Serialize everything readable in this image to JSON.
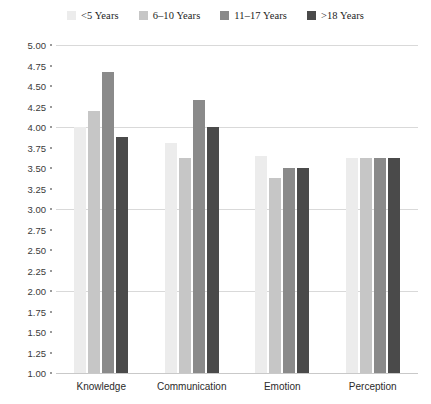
{
  "chart_data": {
    "type": "bar",
    "title": "",
    "xlabel": "",
    "ylabel": "",
    "ylim": [
      1.0,
      5.0
    ],
    "ytick_step": 0.25,
    "grid": true,
    "grid_major_values": [
      5.0,
      4.0,
      3.0,
      2.0,
      1.0
    ],
    "legend_position": "top-center",
    "categories": [
      "Knowledge",
      "Communication",
      "Emotion",
      "Perception"
    ],
    "ytick_labels": [
      "5.00",
      "4.75",
      "4.50",
      "4.25",
      "4.00",
      "3.75",
      "3.50",
      "3.25",
      "3.00",
      "2.75",
      "2.50",
      "2.25",
      "2.00",
      "1.75",
      "1.50",
      "1.25",
      "1.00"
    ],
    "ytick_values": [
      5.0,
      4.75,
      4.5,
      4.25,
      4.0,
      3.75,
      3.5,
      3.25,
      3.0,
      2.75,
      2.5,
      2.25,
      2.0,
      1.75,
      1.5,
      1.25,
      1.0
    ],
    "series": [
      {
        "name": "<5 Years",
        "color": "#ececec",
        "values": [
          4.0,
          3.8,
          3.65,
          3.62
        ]
      },
      {
        "name": "6–10 Years",
        "color": "#c6c6c6",
        "values": [
          4.2,
          3.62,
          3.38,
          3.62
        ]
      },
      {
        "name": "11–17 Years",
        "color": "#8a8a8a",
        "values": [
          4.67,
          4.33,
          3.5,
          3.62
        ]
      },
      {
        "name": ">18 Years",
        "color": "#4a4a4a",
        "values": [
          3.88,
          4.0,
          3.5,
          3.62
        ]
      }
    ]
  },
  "colors": {
    "gridline": "#d9d9d9",
    "axis": "#c9c9c9",
    "tick_text": "#3a3a3a",
    "category_text": "#2b2b2b",
    "legend_text": "#1d1d1d",
    "background": "#ffffff"
  }
}
